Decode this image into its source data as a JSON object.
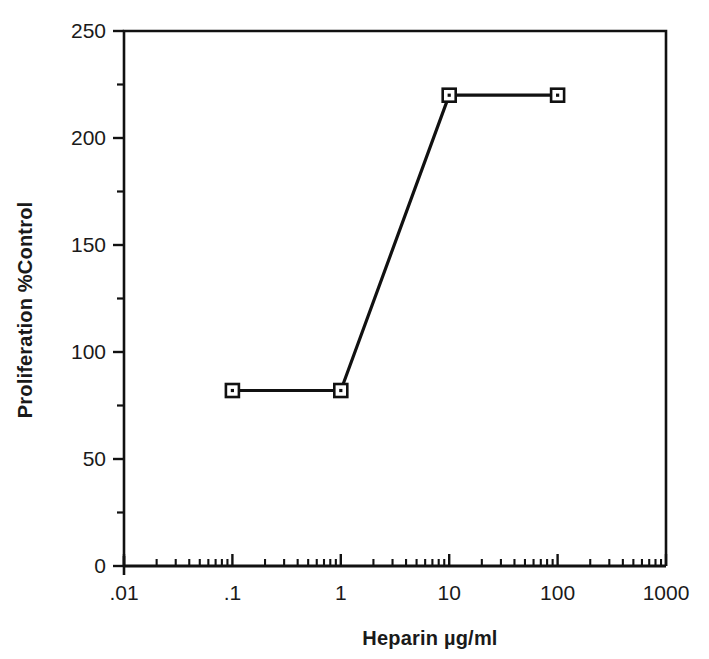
{
  "chart_data": {
    "type": "line",
    "title": "",
    "xlabel": "Heparin  µg/ml",
    "ylabel": "Proliferation  %Control",
    "xscale": "log",
    "xlim": [
      0.01,
      1000
    ],
    "ylim": [
      0,
      250
    ],
    "grid": false,
    "legend": "none",
    "xticks": [
      {
        "value": 0.01,
        "label": ".01"
      },
      {
        "value": 0.1,
        "label": ".1"
      },
      {
        "value": 1,
        "label": "1"
      },
      {
        "value": 10,
        "label": "10"
      },
      {
        "value": 100,
        "label": "100"
      },
      {
        "value": 1000,
        "label": "1000"
      }
    ],
    "yticks": [
      {
        "value": 0,
        "label": "0"
      },
      {
        "value": 50,
        "label": "50"
      },
      {
        "value": 100,
        "label": "100"
      },
      {
        "value": 150,
        "label": "150"
      },
      {
        "value": 200,
        "label": "200"
      },
      {
        "value": 250,
        "label": "250"
      }
    ],
    "yminorticks": [
      25,
      75,
      125,
      175,
      225
    ],
    "series": [
      {
        "name": "Proliferation",
        "marker": "open-square",
        "color": "#111111",
        "x": [
          0.1,
          1,
          10,
          100
        ],
        "y": [
          82,
          82,
          220,
          220
        ]
      }
    ]
  },
  "axis": {
    "x_title": "Heparin  µg/ml",
    "y_title": "Proliferation  %Control",
    "x_tick_labels": [
      ".01",
      ".1",
      "1",
      "10",
      "100",
      "1000"
    ],
    "y_tick_labels": [
      "0",
      "50",
      "100",
      "150",
      "200",
      "250"
    ]
  },
  "style": {
    "ink": "#111111",
    "background": "#ffffff"
  }
}
